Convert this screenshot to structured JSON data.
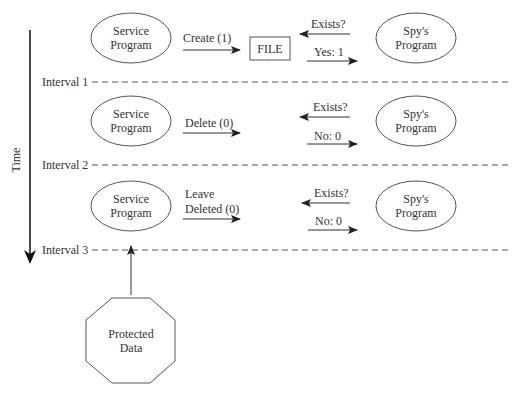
{
  "axis": {
    "label": "Time"
  },
  "intervals": [
    {
      "label": "Interval 1"
    },
    {
      "label": "Interval 2"
    },
    {
      "label": "Interval 3"
    }
  ],
  "rows": [
    {
      "service": {
        "line1": "Service",
        "line2": "Program"
      },
      "action": {
        "line1": "Create (1)",
        "line2": ""
      },
      "file_label": "FILE",
      "query": "Exists?",
      "response": "Yes: 1",
      "spy": {
        "line1": "Spy's",
        "line2": "Program"
      }
    },
    {
      "service": {
        "line1": "Service",
        "line2": "Program"
      },
      "action": {
        "line1": "Delete (0)",
        "line2": ""
      },
      "query": "Exists?",
      "response": "No: 0",
      "spy": {
        "line1": "Spy's",
        "line2": "Program"
      }
    },
    {
      "service": {
        "line1": "Service",
        "line2": "Program"
      },
      "action": {
        "line1": "Leave",
        "line2": "Deleted (0)"
      },
      "query": "Exists?",
      "response": "No: 0",
      "spy": {
        "line1": "Spy's",
        "line2": "Program"
      }
    }
  ],
  "protected": {
    "line1": "Protected",
    "line2": "Data"
  }
}
